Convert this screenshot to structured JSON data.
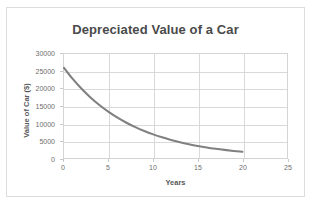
{
  "chart_data": {
    "type": "line",
    "title": "Depreciated Value of a Car",
    "xlabel": "Years",
    "ylabel": "Value of Car ($)",
    "xlim": [
      0,
      25
    ],
    "ylim": [
      0,
      30000
    ],
    "grid": true,
    "legend": "none",
    "line_color": "#808080",
    "xticks": [
      "0",
      "5",
      "10",
      "15",
      "20",
      "25"
    ],
    "yticks": [
      "0",
      "5000",
      "10000",
      "15000",
      "20000",
      "25000",
      "30000"
    ],
    "x": [
      0,
      1,
      2,
      3,
      4,
      5,
      6,
      7,
      8,
      9,
      10,
      11,
      12,
      13,
      14,
      15,
      16,
      17,
      18,
      19,
      20
    ],
    "values": [
      26000,
      22740,
      19890,
      17397,
      15217,
      13310,
      11642,
      10183,
      8906,
      7790,
      6813,
      5959,
      5212,
      4558,
      3987,
      3487,
      3050,
      2668,
      2333,
      2041,
      1785
    ]
  }
}
